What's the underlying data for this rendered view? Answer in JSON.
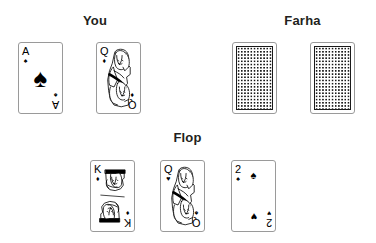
{
  "background_color": "#ffffff",
  "ink_color": "#000000",
  "label_color": "#231f20",
  "card_border_color": "#9a9a9a",
  "groups": {
    "you": {
      "label": "You",
      "cards": [
        {
          "rank": "A",
          "suit_name": "spade",
          "suit_glyph": "♠",
          "center_pip": "♠",
          "kind": "ace"
        },
        {
          "rank": "Q",
          "suit_name": "diamond",
          "suit_glyph": "♦",
          "bottom_suit_glyph": "♦",
          "kind": "face-queen"
        }
      ]
    },
    "farha": {
      "label": "Farha",
      "cards": [
        {
          "kind": "back",
          "face_down_label": "face-down-card"
        },
        {
          "kind": "back",
          "face_down_label": "face-down-card"
        }
      ]
    },
    "flop": {
      "label": "Flop",
      "cards": [
        {
          "rank": "K",
          "suit_name": "diamond",
          "suit_glyph": "♦",
          "bottom_suit_glyph": "♦",
          "kind": "face-king"
        },
        {
          "rank": "Q",
          "suit_name": "heart",
          "suit_glyph": "♥",
          "bottom_suit_glyph": "♠",
          "kind": "face-queen"
        },
        {
          "rank": "2",
          "suit_name": "spade",
          "suit_glyph": "♠",
          "bottom_suit_glyph": "♥",
          "pip_top": "♠",
          "pip_bottom": "♥",
          "kind": "number"
        }
      ]
    }
  }
}
